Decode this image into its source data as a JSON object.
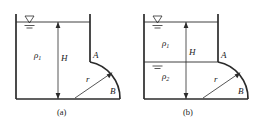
{
  "figure": {
    "panels": [
      {
        "id": "a",
        "caption": "(a)",
        "fluids": [
          {
            "symbol": "ρ",
            "subscript": "1"
          }
        ],
        "dimension_label": "H",
        "radius_label": "r",
        "point_top_label": "A",
        "point_bottom_label": "B",
        "free_surface_symbol": "water-surface-triangle"
      },
      {
        "id": "b",
        "caption": "(b)",
        "fluids": [
          {
            "symbol": "ρ",
            "subscript": "1"
          },
          {
            "symbol": "ρ",
            "subscript": "2"
          }
        ],
        "dimension_label": "H",
        "radius_label": "r",
        "point_top_label": "A",
        "point_bottom_label": "B",
        "free_surface_symbol": "water-surface-triangle",
        "interface_symbol": "interface-surface-mark"
      }
    ],
    "colors": {
      "line": "#2b2b2b",
      "text": "#1a1a1a",
      "background": "#ffffff"
    }
  }
}
